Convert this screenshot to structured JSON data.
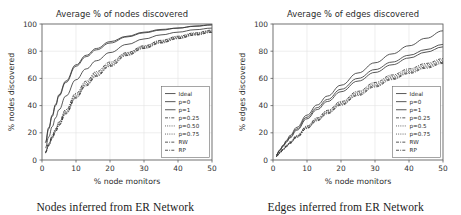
{
  "figure": {
    "panels": [
      {
        "id": "nodes",
        "caption": "Nodes inferred from ER Network",
        "chart_data": {
          "type": "line",
          "title": "Average % of nodes discovered",
          "xlabel": "% node monitors",
          "ylabel": "% nodes discovered",
          "xlim": [
            0,
            50
          ],
          "ylim": [
            0,
            100
          ],
          "xticks": [
            0,
            10,
            20,
            30,
            40,
            50
          ],
          "yticks": [
            0,
            20,
            40,
            60,
            80,
            100
          ],
          "grid": true,
          "legend_position": "lower right",
          "x": [
            1,
            2,
            3,
            4,
            5,
            7,
            10,
            13,
            16,
            20,
            25,
            30,
            35,
            40,
            45,
            50
          ],
          "series": [
            {
              "name": "Ideal",
              "style": "solid",
              "values": [
                13,
                24,
                33,
                41,
                48,
                58,
                70,
                77,
                82,
                87,
                91,
                94,
                96,
                97,
                98.5,
                99.5
              ]
            },
            {
              "name": "p=0",
              "style": "solid",
              "values": [
                12.5,
                23,
                32,
                40,
                47,
                57,
                69,
                76,
                81,
                86,
                90.5,
                93.5,
                95.5,
                97,
                98.3,
                99.3
              ]
            },
            {
              "name": "p=1",
              "style": "solid",
              "values": [
                9,
                17,
                24.5,
                31,
                37,
                47,
                59,
                67,
                73,
                79,
                85,
                89,
                92,
                94,
                95.8,
                97
              ]
            },
            {
              "name": "p=0.25",
              "style": "dashdot",
              "values": [
                6,
                12,
                18,
                23,
                28,
                37,
                49,
                58,
                65,
                72,
                79,
                84,
                88,
                91,
                93.5,
                95.5
              ]
            },
            {
              "name": "p=0.50",
              "style": "dotted",
              "values": [
                5.8,
                11.6,
                17.4,
                22.4,
                27.2,
                36,
                48,
                57,
                64,
                71,
                78.5,
                83.5,
                87.5,
                90.5,
                93,
                95
              ]
            },
            {
              "name": "p=0.75",
              "style": "dotted",
              "values": [
                5.6,
                11.2,
                16.8,
                21.8,
                26.6,
                35.2,
                47,
                56,
                63,
                70.2,
                78,
                83,
                87,
                90,
                92.6,
                94.6
              ]
            },
            {
              "name": "RW",
              "style": "dashdot",
              "values": [
                5.4,
                10.9,
                16.3,
                21.2,
                26,
                34.5,
                46.2,
                55.2,
                62.2,
                69.5,
                77.4,
                82.5,
                86.5,
                89.6,
                92.2,
                94.2
              ]
            },
            {
              "name": "RP",
              "style": "dashdot",
              "values": [
                5.2,
                10.6,
                15.9,
                20.7,
                25.4,
                33.9,
                45.5,
                54.5,
                61.5,
                68.8,
                76.8,
                82,
                86,
                89.2,
                91.8,
                93.8
              ]
            }
          ]
        }
      },
      {
        "id": "edges",
        "caption": "Edges inferred from ER Network",
        "chart_data": {
          "type": "line",
          "title": "Average % of edges discovered",
          "xlabel": "% node monitors",
          "ylabel": "% edges discovered",
          "xlim": [
            0,
            50
          ],
          "ylim": [
            0,
            100
          ],
          "xticks": [
            0,
            10,
            20,
            30,
            40,
            50
          ],
          "yticks": [
            0,
            20,
            40,
            60,
            80,
            100
          ],
          "grid": true,
          "legend_position": "lower right",
          "x": [
            1,
            2,
            3,
            4,
            5,
            7,
            10,
            13,
            16,
            20,
            25,
            30,
            35,
            40,
            45,
            50
          ],
          "series": [
            {
              "name": "Ideal",
              "style": "solid",
              "values": [
                4,
                7.5,
                11,
                14.5,
                18,
                24,
                33,
                40.5,
                47,
                55,
                64,
                71.5,
                78,
                84,
                89.5,
                95
              ]
            },
            {
              "name": "p=0",
              "style": "solid",
              "values": [
                3.8,
                7.2,
                10.5,
                13.8,
                17,
                22.8,
                31.5,
                38.5,
                44.5,
                52,
                60,
                66.5,
                72,
                77,
                81.2,
                85
              ]
            },
            {
              "name": "p=1",
              "style": "solid",
              "values": [
                3.6,
                6.9,
                10.1,
                13.2,
                16.3,
                21.9,
                30.3,
                37.1,
                43,
                50.2,
                58,
                64.4,
                70,
                75,
                79.3,
                83.2
              ]
            },
            {
              "name": "p=0.25",
              "style": "dashdot",
              "values": [
                3,
                5.6,
                8.2,
                10.8,
                13.3,
                18,
                25,
                31,
                36.5,
                43,
                50.5,
                57,
                62.5,
                67,
                71,
                74.5
              ]
            },
            {
              "name": "p=0.5",
              "style": "dotted",
              "values": [
                2.9,
                5.4,
                8,
                10.5,
                13,
                17.6,
                24.5,
                30.4,
                35.8,
                42.2,
                49.6,
                56,
                61.5,
                66,
                70,
                73.5
              ]
            },
            {
              "name": "p=0.75",
              "style": "dotted",
              "values": [
                2.8,
                5.3,
                7.8,
                10.3,
                12.7,
                17.2,
                24,
                29.8,
                35.1,
                41.5,
                48.8,
                55.1,
                60.6,
                65.1,
                69.1,
                72.6
              ]
            },
            {
              "name": "RW",
              "style": "dashdot",
              "values": [
                2.7,
                5.2,
                7.6,
                10.1,
                12.5,
                16.9,
                23.6,
                29.3,
                34.6,
                40.9,
                48.1,
                54.4,
                59.8,
                64.3,
                68.3,
                71.8
              ]
            },
            {
              "name": "RP",
              "style": "dashdot",
              "values": [
                2.6,
                5,
                7.4,
                9.8,
                12.2,
                16.6,
                23.2,
                28.8,
                34,
                40.3,
                47.4,
                53.7,
                59.1,
                63.6,
                67.5,
                71
              ]
            }
          ]
        }
      }
    ]
  }
}
